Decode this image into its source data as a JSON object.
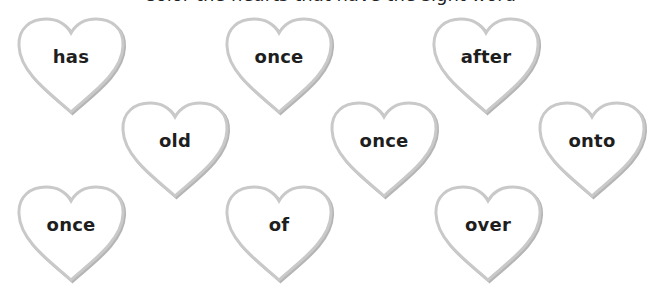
{
  "header": {
    "partial_text": "Color the hearts that have the sight word"
  },
  "style": {
    "heart_stroke": "#c9c9c9",
    "heart_shadow": "#b5b5b5",
    "word_color": "#1e1e1e"
  },
  "hearts": [
    {
      "word": "has",
      "x": 14,
      "y": 16,
      "row": 1,
      "col": 1
    },
    {
      "word": "once",
      "x": 222,
      "y": 16,
      "row": 1,
      "col": 2
    },
    {
      "word": "after",
      "x": 429,
      "y": 16,
      "row": 1,
      "col": 3
    },
    {
      "word": "old",
      "x": 118,
      "y": 100,
      "row": 2,
      "col": 1
    },
    {
      "word": "once",
      "x": 327,
      "y": 100,
      "row": 2,
      "col": 2
    },
    {
      "word": "onto",
      "x": 535,
      "y": 100,
      "row": 2,
      "col": 3
    },
    {
      "word": "once",
      "x": 14,
      "y": 184,
      "row": 3,
      "col": 1
    },
    {
      "word": "of",
      "x": 222,
      "y": 184,
      "row": 3,
      "col": 2
    },
    {
      "word": "over",
      "x": 431,
      "y": 184,
      "row": 3,
      "col": 3
    }
  ]
}
